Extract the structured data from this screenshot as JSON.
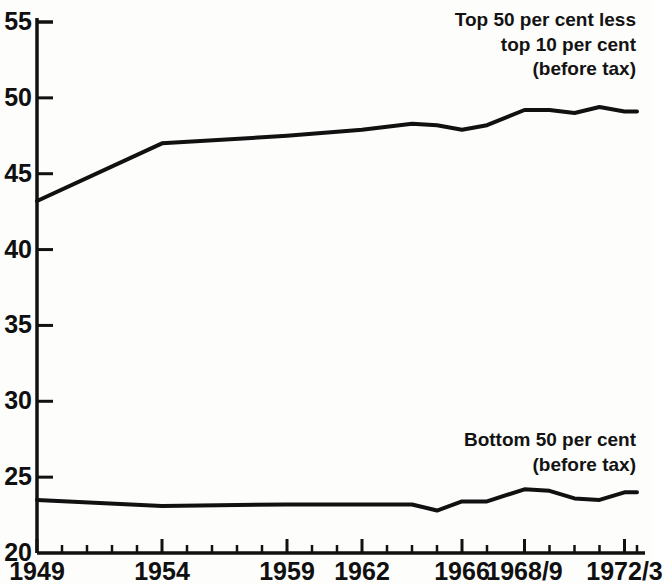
{
  "chart_data": {
    "type": "line",
    "title": "",
    "subtitle": "",
    "xlabel": "",
    "ylabel": "",
    "xlim": [
      1949,
      1973
    ],
    "ylim": [
      20,
      55
    ],
    "grid": false,
    "legend_position": "inline-annotations",
    "y_ticks": [
      20,
      25,
      30,
      35,
      40,
      45,
      50,
      55
    ],
    "y_tick_labels": [
      "20",
      "25",
      "30",
      "35",
      "40",
      "45",
      "50",
      "55"
    ],
    "x_tick_labels": [
      {
        "label": "1949",
        "year": 1949
      },
      {
        "label": "1954",
        "year": 1954
      },
      {
        "label": "1959",
        "year": 1959
      },
      {
        "label": "1962",
        "year": 1962
      },
      {
        "label": "1966",
        "year": 1966
      },
      {
        "label": "1968/9",
        "year": 1968.5
      },
      {
        "label": "1972/3",
        "year": 1972.5
      }
    ],
    "x_minor_tick_years": [
      1949,
      1950,
      1951,
      1952,
      1953,
      1954,
      1955,
      1956,
      1957,
      1958,
      1959,
      1960,
      1961,
      1962,
      1963,
      1964,
      1965,
      1966,
      1967,
      1968.5,
      1969.5,
      1970.5,
      1971.5,
      1972.5,
      1973
    ],
    "series": [
      {
        "name": "Top 50 per cent less top 10 per cent (before tax)",
        "annotation": "Top 50 per cent less\ntop 10 per cent\n(before tax)",
        "color": "#111111",
        "x": [
          1949,
          1954,
          1959,
          1962,
          1964,
          1965,
          1966,
          1967,
          1968.5,
          1969.5,
          1970.5,
          1971.5,
          1972.5,
          1973
        ],
        "values": [
          43.2,
          47.0,
          47.5,
          47.9,
          48.3,
          48.2,
          47.9,
          48.2,
          49.2,
          49.2,
          49.0,
          49.4,
          49.1,
          49.1
        ]
      },
      {
        "name": "Bottom 50 per cent (before tax)",
        "annotation": "Bottom 50 per cent\n(before tax)",
        "color": "#111111",
        "x": [
          1949,
          1954,
          1959,
          1962,
          1964,
          1965,
          1966,
          1967,
          1968.5,
          1969.5,
          1970.5,
          1971.5,
          1972.5,
          1973
        ],
        "values": [
          23.5,
          23.1,
          23.2,
          23.2,
          23.2,
          22.8,
          23.4,
          23.4,
          24.2,
          24.1,
          23.6,
          23.5,
          24.0,
          24.0
        ]
      }
    ],
    "annotations": [
      {
        "id": "top-series-annotation",
        "text": "Top 50 per cent less\ntop 10 per cent\n(before tax)",
        "align": "right"
      },
      {
        "id": "bottom-series-annotation",
        "text": "Bottom 50 per cent\n(before tax)",
        "align": "right"
      }
    ]
  }
}
